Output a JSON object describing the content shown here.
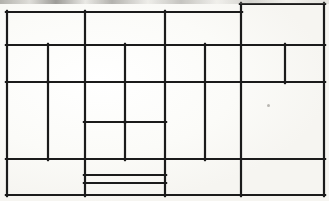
{
  "figure": {
    "kind": "rectangle-dissection-line-drawing",
    "medium": "scanned paper, black ink line drawing",
    "width": 329,
    "height": 201,
    "background_color": "#fdfdfb",
    "line_color": "#1b1b1b",
    "line_width": 2.2,
    "outer_frame": {
      "x": 7,
      "y": 12,
      "width": 317,
      "height": 183
    },
    "caption": "",
    "title": ""
  },
  "chart_data": {
    "type": "diagram",
    "title": "",
    "xlabel": "",
    "ylabel": "",
    "grid": false,
    "legend": null,
    "coordinate_space": {
      "x_range": [
        0,
        329
      ],
      "y_range": [
        0,
        201
      ],
      "units": "pixels"
    },
    "guides": {
      "vertical_x": [
        7,
        48,
        85,
        125,
        165,
        205,
        241,
        285,
        324
      ],
      "horizontal_y": [
        4,
        12,
        45,
        82,
        122,
        159,
        175,
        183,
        195
      ]
    },
    "segments": [
      {
        "id": "h-top-main",
        "orientation": "horizontal",
        "y": 12,
        "x1": 7,
        "x2": 241
      },
      {
        "id": "h-top-right-box",
        "orientation": "horizontal",
        "y": 4,
        "x1": 241,
        "x2": 324
      },
      {
        "id": "h-row1-bottom",
        "orientation": "horizontal",
        "y": 45,
        "x1": 7,
        "x2": 324
      },
      {
        "id": "h-row2-bottom",
        "orientation": "horizontal",
        "y": 82,
        "x1": 7,
        "x2": 324
      },
      {
        "id": "h-mid-inner",
        "orientation": "horizontal",
        "y": 122,
        "x1": 85,
        "x2": 165
      },
      {
        "id": "h-row3-bottom",
        "orientation": "horizontal",
        "y": 159,
        "x1": 7,
        "x2": 324
      },
      {
        "id": "h-bot-inner-upper",
        "orientation": "horizontal",
        "y": 175,
        "x1": 85,
        "x2": 165
      },
      {
        "id": "h-bot-inner-lower",
        "orientation": "horizontal",
        "y": 183,
        "x1": 85,
        "x2": 165
      },
      {
        "id": "h-bottom-edge",
        "orientation": "horizontal",
        "y": 195,
        "x1": 7,
        "x2": 324
      },
      {
        "id": "v-left-edge",
        "orientation": "vertical",
        "x": 7,
        "y1": 12,
        "y2": 195
      },
      {
        "id": "v-48-row2",
        "orientation": "vertical",
        "x": 48,
        "y1": 45,
        "y2": 82
      },
      {
        "id": "v-48-row3",
        "orientation": "vertical",
        "x": 48,
        "y1": 82,
        "y2": 159
      },
      {
        "id": "v-85-full",
        "orientation": "vertical",
        "x": 85,
        "y1": 12,
        "y2": 195
      },
      {
        "id": "v-125-row2",
        "orientation": "vertical",
        "x": 125,
        "y1": 45,
        "y2": 122
      },
      {
        "id": "v-125-row3b",
        "orientation": "vertical",
        "x": 125,
        "y1": 122,
        "y2": 159
      },
      {
        "id": "v-165-main",
        "orientation": "vertical",
        "x": 165,
        "y1": 12,
        "y2": 195
      },
      {
        "id": "v-205-row2",
        "orientation": "vertical",
        "x": 205,
        "y1": 45,
        "y2": 159
      },
      {
        "id": "v-241-right",
        "orientation": "vertical",
        "x": 241,
        "y1": 4,
        "y2": 195
      },
      {
        "id": "v-285-row2",
        "orientation": "vertical",
        "x": 285,
        "y1": 45,
        "y2": 82
      },
      {
        "id": "v-right-edge",
        "orientation": "vertical",
        "x": 324,
        "y1": 4,
        "y2": 195
      }
    ],
    "cells": [
      {
        "id": "r1c1",
        "x": 7,
        "y": 12,
        "width": 78,
        "height": 33,
        "row": 1,
        "col": 1
      },
      {
        "id": "r1c2",
        "x": 85,
        "y": 12,
        "width": 80,
        "height": 33,
        "row": 1,
        "col": 2
      },
      {
        "id": "r1c3",
        "x": 165,
        "y": 12,
        "width": 76,
        "height": 33,
        "row": 1,
        "col": 3
      },
      {
        "id": "r1c4",
        "x": 241,
        "y": 4,
        "width": 83,
        "height": 41,
        "row": 1,
        "col": 4
      },
      {
        "id": "r2c1",
        "x": 7,
        "y": 45,
        "width": 41,
        "height": 37,
        "row": 2,
        "col": 1
      },
      {
        "id": "r2c2",
        "x": 48,
        "y": 45,
        "width": 37,
        "height": 37,
        "row": 2,
        "col": 2
      },
      {
        "id": "r2c3",
        "x": 85,
        "y": 45,
        "width": 40,
        "height": 37,
        "row": 2,
        "col": 3
      },
      {
        "id": "r2c4",
        "x": 125,
        "y": 45,
        "width": 40,
        "height": 37,
        "row": 2,
        "col": 4
      },
      {
        "id": "r2c5",
        "x": 165,
        "y": 45,
        "width": 40,
        "height": 37,
        "row": 2,
        "col": 5
      },
      {
        "id": "r2c6",
        "x": 205,
        "y": 45,
        "width": 36,
        "height": 37,
        "row": 2,
        "col": 6
      },
      {
        "id": "r2c7",
        "x": 241,
        "y": 45,
        "width": 44,
        "height": 37,
        "row": 2,
        "col": 7
      },
      {
        "id": "r2c8",
        "x": 285,
        "y": 45,
        "width": 39,
        "height": 37,
        "row": 2,
        "col": 8
      },
      {
        "id": "r3c1",
        "x": 7,
        "y": 82,
        "width": 41,
        "height": 77,
        "row": 3,
        "col": 1
      },
      {
        "id": "r3c2",
        "x": 48,
        "y": 82,
        "width": 37,
        "height": 77,
        "row": 3,
        "col": 2
      },
      {
        "id": "r3c3",
        "x": 85,
        "y": 82,
        "width": 40,
        "height": 40,
        "row": 3,
        "col": 3
      },
      {
        "id": "r3c4",
        "x": 125,
        "y": 82,
        "width": 40,
        "height": 40,
        "row": 3,
        "col": 4
      },
      {
        "id": "r3c5",
        "x": 85,
        "y": 122,
        "width": 40,
        "height": 37,
        "row": 3,
        "col": 5
      },
      {
        "id": "r3c6",
        "x": 125,
        "y": 122,
        "width": 40,
        "height": 37,
        "row": 3,
        "col": 6
      },
      {
        "id": "r3c7",
        "x": 165,
        "y": 82,
        "width": 40,
        "height": 77,
        "row": 3,
        "col": 7
      },
      {
        "id": "r3c8",
        "x": 205,
        "y": 82,
        "width": 36,
        "height": 77,
        "row": 3,
        "col": 8
      },
      {
        "id": "r3c9",
        "x": 241,
        "y": 82,
        "width": 83,
        "height": 77,
        "row": 3,
        "col": 9
      },
      {
        "id": "r4c1",
        "x": 7,
        "y": 159,
        "width": 78,
        "height": 36,
        "row": 4,
        "col": 1
      },
      {
        "id": "r4c2",
        "x": 85,
        "y": 159,
        "width": 80,
        "height": 16,
        "row": 4,
        "col": 2
      },
      {
        "id": "r4c3",
        "x": 85,
        "y": 175,
        "width": 80,
        "height": 8,
        "row": 4,
        "col": 3
      },
      {
        "id": "r4c4",
        "x": 85,
        "y": 183,
        "width": 80,
        "height": 12,
        "row": 4,
        "col": 4
      },
      {
        "id": "r4c5",
        "x": 165,
        "y": 159,
        "width": 76,
        "height": 36,
        "row": 4,
        "col": 5
      },
      {
        "id": "r4c6",
        "x": 241,
        "y": 159,
        "width": 83,
        "height": 36,
        "row": 4,
        "col": 6
      }
    ],
    "artifacts": [
      {
        "id": "top-edge-scan-band",
        "type": "scan-noise-band",
        "x": 0,
        "y": 0,
        "width": 329,
        "height": 4
      },
      {
        "id": "gray-speck",
        "type": "dust-speck",
        "x": 267,
        "y": 104,
        "width": 3,
        "height": 3,
        "color": "#b9b7b2"
      }
    ]
  }
}
